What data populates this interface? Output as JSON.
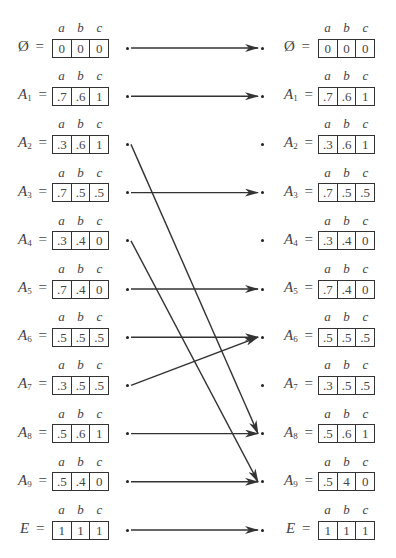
{
  "diagram": {
    "type": "fuzzy-set-mapping",
    "columns": [
      "a",
      "b",
      "c"
    ],
    "left_sets": [
      {
        "name": "Ø",
        "sub": "",
        "values": [
          "0",
          "0",
          "0"
        ]
      },
      {
        "name": "A",
        "sub": "1",
        "values": [
          ".7",
          ".6",
          "1"
        ]
      },
      {
        "name": "A",
        "sub": "2",
        "values": [
          ".3",
          ".6",
          "1"
        ]
      },
      {
        "name": "A",
        "sub": "3",
        "values": [
          ".7",
          ".5",
          ".5"
        ]
      },
      {
        "name": "A",
        "sub": "4",
        "values": [
          ".3",
          ".4",
          "0"
        ]
      },
      {
        "name": "A",
        "sub": "5",
        "values": [
          ".7",
          ".4",
          "0"
        ]
      },
      {
        "name": "A",
        "sub": "6",
        "values": [
          ".5",
          ".5",
          ".5"
        ]
      },
      {
        "name": "A",
        "sub": "7",
        "values": [
          ".3",
          ".5",
          ".5"
        ]
      },
      {
        "name": "A",
        "sub": "8",
        "values": [
          ".5",
          ".6",
          "1"
        ]
      },
      {
        "name": "A",
        "sub": "9",
        "values": [
          ".5",
          ".4",
          "0"
        ]
      },
      {
        "name": "E",
        "sub": "",
        "values": [
          "1",
          "1",
          "1"
        ]
      }
    ],
    "right_sets": [
      {
        "name": "Ø",
        "sub": "",
        "values": [
          "0",
          "0",
          "0"
        ]
      },
      {
        "name": "A",
        "sub": "1",
        "values": [
          ".7",
          ".6",
          "1"
        ]
      },
      {
        "name": "A",
        "sub": "2",
        "values": [
          ".3",
          ".6",
          "1"
        ]
      },
      {
        "name": "A",
        "sub": "3",
        "values": [
          ".7",
          ".5",
          ".5"
        ]
      },
      {
        "name": "A",
        "sub": "4",
        "values": [
          ".3",
          ".4",
          "0"
        ]
      },
      {
        "name": "A",
        "sub": "5",
        "values": [
          ".7",
          ".4",
          "0"
        ]
      },
      {
        "name": "A",
        "sub": "6",
        "values": [
          ".5",
          ".5",
          ".5"
        ]
      },
      {
        "name": "A",
        "sub": "7",
        "values": [
          ".3",
          ".5",
          ".5"
        ]
      },
      {
        "name": "A",
        "sub": "8",
        "values": [
          ".5",
          ".6",
          "1"
        ]
      },
      {
        "name": "A",
        "sub": "9",
        "values": [
          ".5",
          "4",
          "0"
        ]
      },
      {
        "name": "E",
        "sub": "",
        "values": [
          "1",
          "1",
          "1"
        ]
      }
    ],
    "mappings": [
      {
        "from": 0,
        "to": 0
      },
      {
        "from": 1,
        "to": 1
      },
      {
        "from": 2,
        "to": 8
      },
      {
        "from": 3,
        "to": 3
      },
      {
        "from": 4,
        "to": 9
      },
      {
        "from": 5,
        "to": 5
      },
      {
        "from": 6,
        "to": 6
      },
      {
        "from": 7,
        "to": 6
      },
      {
        "from": 8,
        "to": 8
      },
      {
        "from": 9,
        "to": 9
      },
      {
        "from": 10,
        "to": 10
      }
    ],
    "equals_sign": "=",
    "line_color": "#333333"
  }
}
